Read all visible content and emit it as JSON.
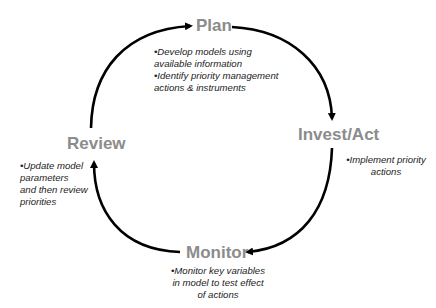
{
  "diagram": {
    "type": "cycle",
    "colors": {
      "label": "#8c8c8c",
      "arrow": "#000000",
      "text": "#222222"
    },
    "stages": [
      {
        "name": "Plan",
        "bullets": [
          "•Develop models using",
          "available information",
          "•Identify priority management",
          "actions & instruments"
        ]
      },
      {
        "name": "Invest/Act",
        "bullets": [
          "•Implement priority",
          "actions"
        ]
      },
      {
        "name": "Monitor",
        "bullets": [
          "•Monitor key variables",
          "in model to test effect",
          "of actions"
        ]
      },
      {
        "name": "Review",
        "bullets": [
          "•Update model",
          "parameters",
          "and then review",
          "priorities"
        ]
      }
    ],
    "flow": [
      "Plan",
      "Invest/Act",
      "Monitor",
      "Review",
      "Plan"
    ]
  }
}
